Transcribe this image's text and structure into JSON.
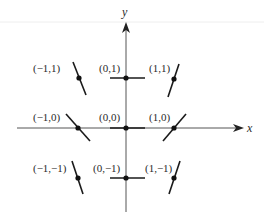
{
  "diagram": {
    "type": "slope-field",
    "axes": {
      "x_label": "x",
      "y_label": "y",
      "color": "#555555"
    },
    "colors": {
      "axis": "#555555",
      "segment": "#1a1a1a",
      "point": "#111111",
      "label": "#2a2a2a",
      "background": "#ffffff"
    },
    "points": [
      {
        "x": -1,
        "y": 1,
        "label": "(−1,1)",
        "slope": "steep-negative"
      },
      {
        "x": 0,
        "y": 1,
        "label": "(0,1)",
        "slope": "zero"
      },
      {
        "x": 1,
        "y": 1,
        "label": "(1,1)",
        "slope": "steep-positive"
      },
      {
        "x": -1,
        "y": 0,
        "label": "(−1,0)",
        "slope": "negative"
      },
      {
        "x": 0,
        "y": 0,
        "label": "(0,0)",
        "slope": "zero"
      },
      {
        "x": 1,
        "y": 0,
        "label": "(1,0)",
        "slope": "positive"
      },
      {
        "x": -1,
        "y": -1,
        "label": "(−1,−1)",
        "slope": "steep-negative"
      },
      {
        "x": 0,
        "y": -1,
        "label": "(0,−1)",
        "slope": "zero"
      },
      {
        "x": 1,
        "y": -1,
        "label": "(1,−1)",
        "slope": "steep-positive"
      }
    ]
  }
}
